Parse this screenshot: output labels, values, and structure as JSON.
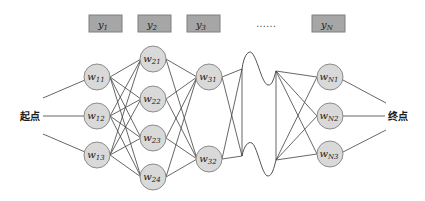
{
  "diagram": {
    "start_label": "起点",
    "end_label": "终点",
    "ellipsis": "……",
    "colors": {
      "node_fill": "#d9d9d9",
      "node_stroke": "#8c8c8c",
      "box_fill": "#a6a6a6",
      "box_stroke": "#7f7f7f",
      "edge": "#404040"
    },
    "outputs": [
      {
        "base": "y",
        "sub": "1"
      },
      {
        "base": "y",
        "sub": "2"
      },
      {
        "base": "y",
        "sub": "3"
      },
      {
        "base": "y",
        "sub": "N"
      }
    ],
    "layers": [
      {
        "name": "layer-1",
        "nodes": [
          {
            "base": "w",
            "sub": "11"
          },
          {
            "base": "w",
            "sub": "12"
          },
          {
            "base": "w",
            "sub": "13"
          }
        ]
      },
      {
        "name": "layer-2",
        "nodes": [
          {
            "base": "w",
            "sub": "21"
          },
          {
            "base": "w",
            "sub": "22"
          },
          {
            "base": "w",
            "sub": "23"
          },
          {
            "base": "w",
            "sub": "24"
          }
        ]
      },
      {
        "name": "layer-3",
        "nodes": [
          {
            "base": "w",
            "sub": "31"
          },
          {
            "base": "w",
            "sub": "32"
          }
        ]
      },
      {
        "name": "layer-N",
        "nodes": [
          {
            "base": "w",
            "sub": "N1"
          },
          {
            "base": "w",
            "sub": "N2"
          },
          {
            "base": "w",
            "sub": "N3"
          }
        ]
      }
    ]
  }
}
